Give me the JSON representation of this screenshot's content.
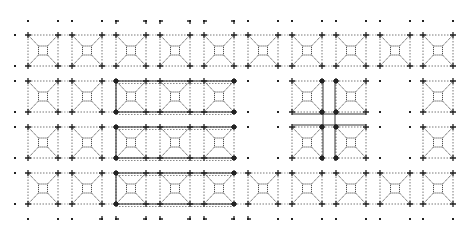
{
  "diagram": {
    "type": "architectural-floor-plan",
    "colors": {
      "background": "#ffffff",
      "ink": "#222222",
      "light_ink": "#555555"
    },
    "grid": {
      "cols_x": [
        28,
        72,
        116,
        160,
        204,
        248,
        292,
        336,
        380,
        423
      ],
      "cell_width": 30,
      "rows_y": [
        35,
        81,
        127,
        173
      ],
      "cell_height": 31,
      "top_dot_row_y": 21,
      "bottom_dot_row_y": 219,
      "left_dot_x": 15,
      "right_dot_x": 466
    },
    "missing_cells": [
      [
        5,
        1
      ],
      [
        5,
        2
      ],
      [
        8,
        1
      ],
      [
        8,
        2
      ]
    ],
    "heavy_group": {
      "col_start": 2,
      "col_end": 4,
      "row_start": 1,
      "row_end": 3
    },
    "cross_group": {
      "col_start": 6,
      "col_end": 7,
      "row_start": 1,
      "row_end": 2
    },
    "top_brackets_x": [
      116,
      146,
      160,
      190,
      204,
      234
    ],
    "bottom_brackets_x": [
      102,
      116,
      146,
      160,
      190,
      204,
      234,
      248
    ]
  }
}
